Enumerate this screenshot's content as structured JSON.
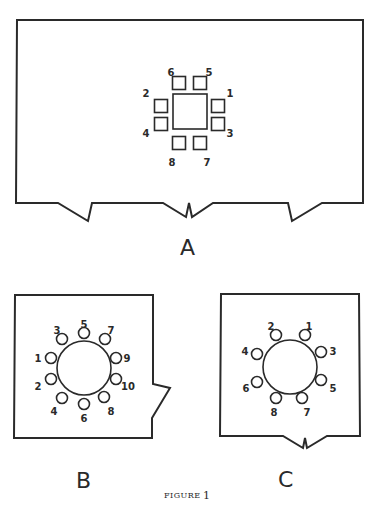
{
  "figure": {
    "caption_word": "FIGURE",
    "caption_number": "1"
  },
  "panels": {
    "A": {
      "label": "A",
      "pin_shape": "square",
      "center_shape": "square",
      "pins": [
        {
          "num": "1",
          "x": 218,
          "y": 106,
          "lx": 230,
          "ly": 94
        },
        {
          "num": "2",
          "x": 161,
          "y": 106,
          "lx": 146,
          "ly": 94
        },
        {
          "num": "3",
          "x": 218,
          "y": 124,
          "lx": 230,
          "ly": 134
        },
        {
          "num": "4",
          "x": 161,
          "y": 124,
          "lx": 146,
          "ly": 134
        },
        {
          "num": "5",
          "x": 200,
          "y": 83,
          "lx": 209,
          "ly": 73
        },
        {
          "num": "6",
          "x": 179,
          "y": 83,
          "lx": 171,
          "ly": 73
        },
        {
          "num": "7",
          "x": 200,
          "y": 143,
          "lx": 207,
          "ly": 163
        },
        {
          "num": "8",
          "x": 179,
          "y": 143,
          "lx": 172,
          "ly": 163
        }
      ]
    },
    "B": {
      "label": "B",
      "pin_shape": "circle",
      "center_shape": "circle",
      "pins": [
        {
          "num": "1",
          "x": 51,
          "y": 358,
          "lx": 38,
          "ly": 359
        },
        {
          "num": "2",
          "x": 51,
          "y": 379,
          "lx": 38,
          "ly": 387
        },
        {
          "num": "3",
          "x": 62,
          "y": 339,
          "lx": 57,
          "ly": 331
        },
        {
          "num": "4",
          "x": 62,
          "y": 398,
          "lx": 54,
          "ly": 412
        },
        {
          "num": "5",
          "x": 84,
          "y": 333,
          "lx": 84,
          "ly": 325
        },
        {
          "num": "6",
          "x": 84,
          "y": 404,
          "lx": 84,
          "ly": 419
        },
        {
          "num": "7",
          "x": 105,
          "y": 339,
          "lx": 111,
          "ly": 331
        },
        {
          "num": "8",
          "x": 104,
          "y": 397,
          "lx": 111,
          "ly": 412
        },
        {
          "num": "9",
          "x": 116,
          "y": 358,
          "lx": 127,
          "ly": 359
        },
        {
          "num": "10",
          "x": 116,
          "y": 379,
          "lx": 128,
          "ly": 387
        }
      ]
    },
    "C": {
      "label": "C",
      "pin_shape": "circle",
      "center_shape": "circle",
      "pins": [
        {
          "num": "1",
          "x": 305,
          "y": 335,
          "lx": 309,
          "ly": 327
        },
        {
          "num": "2",
          "x": 276,
          "y": 335,
          "lx": 271,
          "ly": 327
        },
        {
          "num": "3",
          "x": 321,
          "y": 352,
          "lx": 333,
          "ly": 352
        },
        {
          "num": "4",
          "x": 257,
          "y": 354,
          "lx": 245,
          "ly": 352
        },
        {
          "num": "5",
          "x": 321,
          "y": 380,
          "lx": 333,
          "ly": 389
        },
        {
          "num": "6",
          "x": 257,
          "y": 382,
          "lx": 246,
          "ly": 389
        },
        {
          "num": "7",
          "x": 302,
          "y": 398,
          "lx": 307,
          "ly": 413
        },
        {
          "num": "8",
          "x": 276,
          "y": 398,
          "lx": 274,
          "ly": 413
        }
      ]
    }
  }
}
